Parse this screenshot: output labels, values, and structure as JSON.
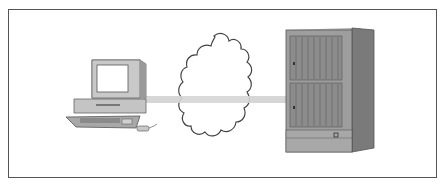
{
  "diagram": {
    "type": "network-connection",
    "nodes": [
      {
        "id": "client",
        "label": "",
        "kind": "desktop-computer"
      },
      {
        "id": "network",
        "label": "",
        "kind": "cloud"
      },
      {
        "id": "host",
        "label": "",
        "kind": "mainframe-cabinet"
      }
    ],
    "edges": [
      {
        "from": "client",
        "to": "host",
        "via": "network",
        "style": "thick-gray-band"
      }
    ],
    "colors": {
      "border": "#555555",
      "link": "#d4d4d4",
      "device_light": "#c8c8c8",
      "device_dark": "#8a8a8a",
      "cloud_stroke": "#444444"
    }
  }
}
